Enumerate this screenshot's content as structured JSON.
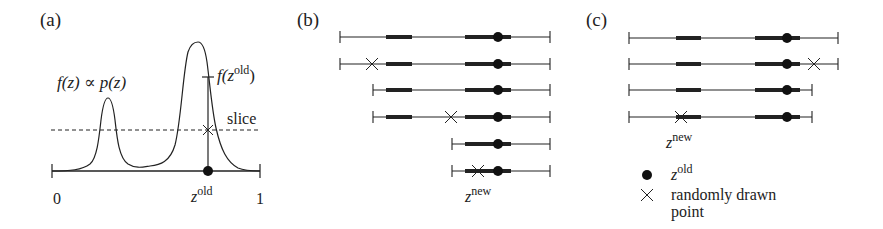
{
  "figure": {
    "colors": {
      "ink": "#222222",
      "background": "#ffffff"
    }
  },
  "panel_a": {
    "label": "(a)",
    "function_label": "f(z) ∝ p(z)",
    "fz_old_label_f": "f(z",
    "fz_old_label_sup": "old",
    "fz_old_label_close": ")",
    "slice_label": "slice",
    "axis_min": "0",
    "axis_max": "1",
    "zold_base": "z",
    "zold_sup": "old"
  },
  "panel_b": {
    "label": "(b)",
    "rows": 6,
    "znew_base": "z",
    "znew_sup": "new"
  },
  "panel_c": {
    "label": "(c)",
    "rows": 4,
    "znew_base": "z",
    "znew_sup": "new"
  },
  "legend": {
    "items": [
      {
        "icon": "filled-circle",
        "base": "z",
        "sup": "old"
      },
      {
        "icon": "cross",
        "text_line1": "randomly drawn",
        "text_line2": "point"
      }
    ]
  }
}
